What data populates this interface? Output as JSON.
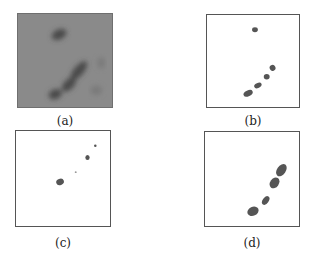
{
  "figure": {
    "panels": [
      {
        "id": "a",
        "caption": "(a)",
        "type": "grayscale-image"
      },
      {
        "id": "b",
        "caption": "(b)",
        "type": "binary-mask"
      },
      {
        "id": "c",
        "caption": "(c)",
        "type": "binary-mask"
      },
      {
        "id": "d",
        "caption": "(d)",
        "type": "binary-mask"
      }
    ]
  }
}
